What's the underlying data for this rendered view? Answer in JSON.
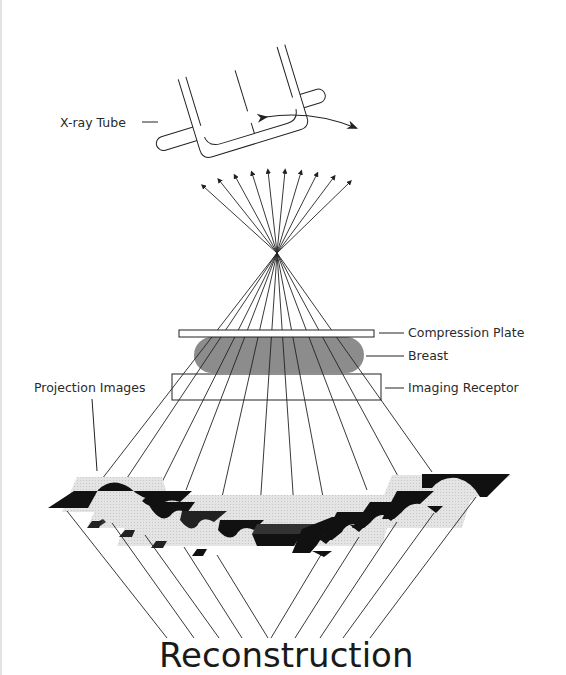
{
  "diagram": {
    "title": "Reconstruction",
    "labels": {
      "xray_tube": "X-ray Tube",
      "compression_plate": "Compression Plate",
      "breast": "Breast",
      "imaging_receptor": "Imaging Receptor",
      "projection_images": "Projection Images"
    },
    "colors": {
      "line": "#222222",
      "breast_fill": "#8c8c8c",
      "projection_dark": "#111111",
      "projection_light": "#d9d9d9",
      "projection_mid": "#555555"
    },
    "ray_count": 11
  }
}
